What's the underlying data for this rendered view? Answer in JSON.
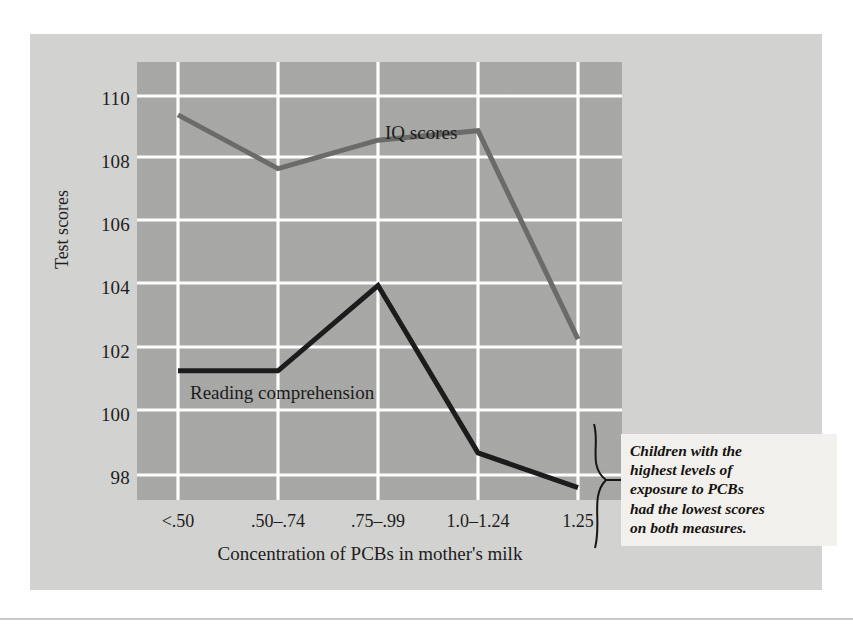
{
  "figure": {
    "background_color": "#d3d3d1",
    "plot_background_color": "#a8a8a6",
    "gridline_color": "#ffffff"
  },
  "axes": {
    "y_title": "Test scores",
    "x_title": "Concentration of PCBs in mother's milk",
    "y_ticks": [
      "110",
      "108",
      "106",
      "104",
      "102",
      "100",
      "98"
    ],
    "y_tick_values": [
      110,
      108,
      106,
      104,
      102,
      100,
      98
    ],
    "x_ticks": [
      "<.50",
      ".50–.74",
      ".75–.99",
      "1.0–1.24",
      "1.25"
    ]
  },
  "series_labels": {
    "iq": "IQ scores",
    "reading": "Reading comprehension"
  },
  "annotation": {
    "text": "Children with the highest levels of exposure to PCBs had the lowest scores on both measures.",
    "lines": [
      "Children with the",
      "highest levels of",
      "exposure to PCBs",
      "had the lowest scores",
      "on both measures."
    ]
  },
  "chart_data": {
    "type": "line",
    "title": "",
    "xlabel": "Concentration of PCBs in mother's milk",
    "ylabel": "Test scores",
    "categories": [
      "<.50",
      ".50–.74",
      ".75–.99",
      "1.0–1.24",
      "1.25"
    ],
    "ylim": [
      96.8,
      110.9
    ],
    "xlim": [
      0,
      6
    ],
    "grid": true,
    "legend": "in-plot labels",
    "series": [
      {
        "name": "IQ scores",
        "color": "#6b6b69",
        "line_width": 5,
        "values": [
          109.4,
          107.7,
          108.6,
          108.9,
          102.3
        ]
      },
      {
        "name": "Reading comprehension",
        "color": "#1b1b1b",
        "line_width": 5,
        "values": [
          101.3,
          101.3,
          104.0,
          98.7,
          97.6
        ]
      }
    ],
    "annotations": [
      {
        "text": "Children with the highest levels of exposure to PCBs had the lowest scores on both measures.",
        "points_to": [
          "IQ scores @1.25",
          "Reading comprehension @1.25"
        ]
      }
    ]
  }
}
